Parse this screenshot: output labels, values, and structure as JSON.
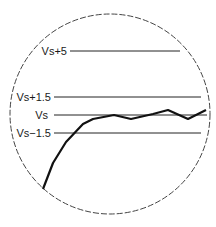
{
  "diagram": {
    "type": "magnified-view",
    "circle": {
      "cx": 110,
      "cy": 114,
      "r": 100,
      "stroke": "#444444",
      "dash": "6 2"
    },
    "reference_lines": [
      {
        "label": "Vs+5",
        "y": 51,
        "x1": 70,
        "x2": 180,
        "label_x": 67
      },
      {
        "label": "Vs+1.5",
        "y": 97,
        "x1": 54,
        "x2": 201,
        "label_x": 51
      },
      {
        "label": "Vs",
        "y": 115,
        "x1": 54,
        "x2": 207,
        "label_x": 48
      },
      {
        "label": "Vs−1.5",
        "y": 133,
        "x1": 54,
        "x2": 201,
        "label_x": 51
      }
    ],
    "curve": {
      "stroke": "#111111",
      "points": [
        [
          43,
          189
        ],
        [
          53,
          163
        ],
        [
          66,
          142
        ],
        [
          83,
          124
        ],
        [
          93,
          119
        ],
        [
          114,
          115
        ],
        [
          131,
          119
        ],
        [
          153,
          114
        ],
        [
          168,
          110
        ],
        [
          188,
          119
        ],
        [
          206,
          110
        ]
      ]
    }
  }
}
